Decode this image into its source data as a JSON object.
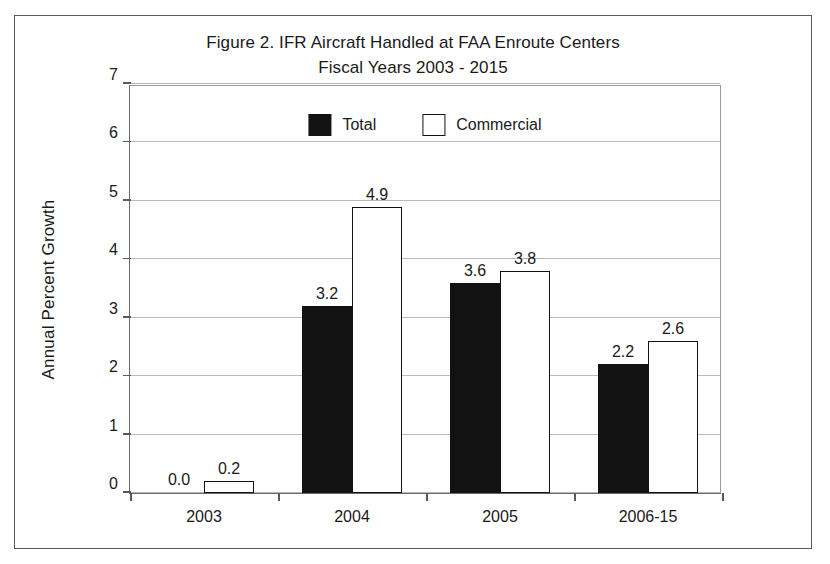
{
  "figure": {
    "title_line1": "Figure 2.  IFR Aircraft Handled at FAA Enroute Centers",
    "title_line2": "Fiscal Years 2003 - 2015"
  },
  "chart_data": {
    "type": "bar",
    "title": "Figure 2.  IFR Aircraft Handled at FAA Enroute Centers Fiscal Years 2003 - 2015",
    "xlabel": "",
    "ylabel": "Annual Percent Growth",
    "ylim": [
      0,
      7
    ],
    "yticks": [
      "0",
      "1",
      "2",
      "3",
      "4",
      "5",
      "6",
      "7"
    ],
    "grid": true,
    "legend_position": "top-center",
    "categories": [
      "2003",
      "2004",
      "2005",
      "2006-15"
    ],
    "series": [
      {
        "name": "Total",
        "color": "#121212",
        "values": [
          0.0,
          3.2,
          3.6,
          2.2
        ],
        "labels": [
          "0.0",
          "3.2",
          "3.6",
          "2.2"
        ]
      },
      {
        "name": "Commercial",
        "color": "#ffffff",
        "values": [
          0.2,
          4.9,
          3.8,
          2.6
        ],
        "labels": [
          "0.2",
          "4.9",
          "3.8",
          "2.6"
        ]
      }
    ]
  }
}
